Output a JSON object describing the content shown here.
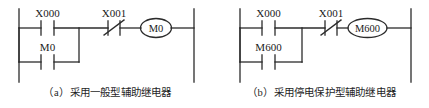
{
  "figure": {
    "panels": [
      {
        "id": "a",
        "caption_index": "（a）",
        "caption_text": "采用一般型辅助继电器",
        "rung": {
          "contacts": [
            {
              "name": "X000",
              "type": "normally-open",
              "position": "series-top"
            },
            {
              "name": "X001",
              "type": "normally-closed",
              "position": "series-top"
            },
            {
              "name": "M0",
              "type": "normally-open",
              "position": "branch-parallel"
            }
          ],
          "coil": {
            "name": "M0",
            "type": "output-coil"
          }
        }
      },
      {
        "id": "b",
        "caption_index": "（b）",
        "caption_text": "采用停电保护型辅助继电器",
        "rung": {
          "contacts": [
            {
              "name": "X000",
              "type": "normally-open",
              "position": "series-top"
            },
            {
              "name": "X001",
              "type": "normally-closed",
              "position": "series-top"
            },
            {
              "name": "M600",
              "type": "normally-open",
              "position": "branch-parallel"
            }
          ],
          "coil": {
            "name": "M600",
            "type": "output-coil"
          }
        }
      }
    ],
    "labels": {
      "a_x000": "X000",
      "a_x001": "X001",
      "a_m0_branch": "M0",
      "a_m0_coil": "M0",
      "b_x000": "X000",
      "b_x001": "X001",
      "b_m600_branch": "M600",
      "b_m600_coil": "M600",
      "a_caption_index": "（a）",
      "a_caption_text": "采用一般型辅助继电器",
      "b_caption_index": "（b）",
      "b_caption_text": "采用停电保护型辅助继电器"
    },
    "colors": {
      "line": "#2b2b2b",
      "text": "#1a1a1a",
      "background": "#ffffff"
    }
  }
}
